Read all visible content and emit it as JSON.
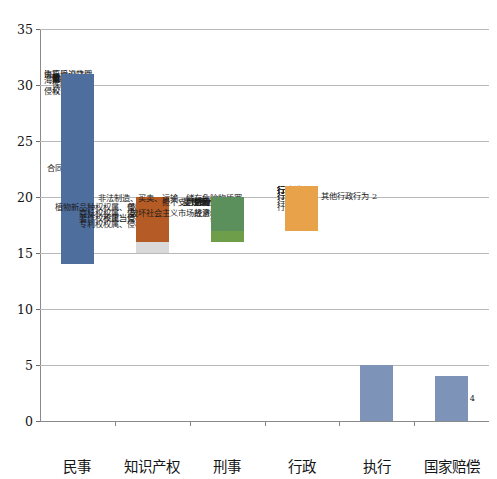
{
  "chart_data": {
    "type": "bar",
    "subtype": "stacked-bar",
    "title": "",
    "subtitle": "",
    "xlabel": "",
    "ylabel": "",
    "ylim": [
      0,
      35
    ],
    "ytick_step": 5,
    "yticks": [
      "0",
      "5",
      "10",
      "15",
      "20",
      "25",
      "30",
      "35"
    ],
    "grid": true,
    "legend": "none",
    "categories": [
      "民事",
      "知识产权",
      "刑事",
      "行政",
      "执行",
      "国家赔偿"
    ],
    "totals": [
      31,
      20,
      20,
      21,
      5,
      4
    ],
    "series": [
      {
        "category": "民事",
        "total": 31,
        "segments": [
          {
            "label": "执行异议之诉",
            "value": 1,
            "color": "#9bbb7a",
            "label_side": "left"
          },
          {
            "label": "物权纠纷",
            "value": 1,
            "color": "#d7a93c",
            "label_side": "left"
          },
          {
            "label": "侵权责任纠纷",
            "value": 4,
            "color": "#d7a93c",
            "label_side": "left"
          },
          {
            "label": "破产纠纷",
            "value": 1,
            "color": "#6f9e4a",
            "label_side": "left"
          },
          {
            "label": "离婚纠纷",
            "value": 1,
            "color": "#d18c3c",
            "label_side": "left"
          },
          {
            "label": "劳动争议",
            "value": 1,
            "color": "#9aa98c",
            "label_side": "left"
          },
          {
            "label": "债权纠纷",
            "value": 1,
            "color": "#6b86ad",
            "label_side": "left"
          },
          {
            "label": "合同纠纷",
            "value": 17,
            "color": "#4e6e9e",
            "label_side": "left"
          },
          {
            "label": "海事诉讼特别程序",
            "value": 1,
            "color": "#4e6e9e",
            "label_side": "left"
          },
          {
            "label": "海事海商纠纷",
            "value": 2,
            "color": "#4e6e9e",
            "label_side": "left"
          },
          {
            "label": "公司纠纷",
            "value": 3,
            "color": "#4e6e9e",
            "label_side": "left"
          },
          {
            "label": "保险纠纷",
            "value": 2,
            "color": "#4e6e9e",
            "label_side": "left"
          }
        ]
      },
      {
        "category": "知识产权",
        "total": 20,
        "segments": [
          {
            "label": "专利权权属、侵权纠纷",
            "value": 5,
            "color": "#d9d9d9",
            "label_side": "left"
          },
          {
            "label": "著作权权属、侵权纠纷",
            "value": 4,
            "color": "#f2c49a",
            "label_side": "left"
          },
          {
            "label": "植物新品种权权属、侵权纠纷",
            "value": 2,
            "color": "#f2c49a",
            "label_side": "left"
          },
          {
            "label": "商标权权属、侵权纠纷",
            "value": 3,
            "color": "#6b86ad",
            "label_side": "left"
          },
          {
            "label": "垄断纠纷",
            "value": 2,
            "color": "#6b86ad",
            "label_side": "left"
          },
          {
            "label": "不正当竞争纠纷",
            "value": 4,
            "color": "#b55b25",
            "label_side": "left"
          }
        ]
      },
      {
        "category": "刑事",
        "total": 20,
        "segments": [
          {
            "label": "危险驾驶罪",
            "value": 1,
            "color": "#e08b3c",
            "label_side": "left"
          },
          {
            "label": "非法制造、买卖、运输、储存危险物质罪",
            "value": 1,
            "color": "#e08b3c",
            "label_side": "left"
          },
          {
            "label": "受贿罪/贪污罪",
            "value": 1,
            "color": "#e08b3c",
            "label_side": "left"
          },
          {
            "label": "受贿罪",
            "value": 1,
            "color": "#6f9e4a",
            "label_side": "left"
          },
          {
            "label": "抢劫罪",
            "value": 4,
            "color": "#6f9e4a",
            "label_side": "left"
          },
          {
            "label": "破坏社会主义市场经济秩序罪",
            "value": 3,
            "color": "#6b86ad",
            "label_side": "left"
          },
          {
            "label": "拒不支付劳动报酬罪",
            "value": 1,
            "color": "#6b86ad",
            "label_side": "left"
          },
          {
            "label": "合同诈骗罪",
            "value": 1,
            "color": "#6b86ad",
            "label_side": "left"
          },
          {
            "label": "故意伤人罪",
            "value": 3,
            "color": "#5b8f5b",
            "label_side": "left"
          },
          {
            "label": "妨害司法罪",
            "value": 1,
            "color": "#5b8f5b",
            "label_side": "left"
          },
          {
            "label": "盗窃罪/诈骗罪",
            "value": 1,
            "color": "#5b8f5b",
            "label_side": "left"
          }
        ]
      },
      {
        "category": "行政",
        "total": 21,
        "segments": [
          {
            "label": "行政登记",
            "value": 1,
            "color": "#e8a34a",
            "label_side": "left"
          },
          {
            "label": "其他行政行为",
            "value": 2,
            "color": "#e08b3c",
            "label_side": "right"
          },
          {
            "label": "行政征收",
            "value": 1,
            "color": "#e08b3c",
            "label_side": "left"
          },
          {
            "label": "行政许可",
            "value": 3,
            "color": "#8a8a8a",
            "label_side": "left"
          },
          {
            "label": "行政受理",
            "value": 1,
            "color": "#e8a34a",
            "label_side": "left"
          },
          {
            "label": "行政确认",
            "value": 2,
            "color": "#6b86ad",
            "label_side": "left"
          },
          {
            "label": "行政批准",
            "value": 2,
            "color": "#5b8f5b",
            "label_side": "left"
          },
          {
            "label": "行政合同",
            "value": 1,
            "color": "#6b86ad",
            "label_side": "left"
          },
          {
            "label": "行政处罚",
            "value": 4,
            "color": "#e8a34a",
            "label_side": "left"
          }
        ]
      },
      {
        "category": "执行",
        "total": 5,
        "segments": [
          {
            "label": "执行",
            "value": 5,
            "color": "#7e93b8",
            "label_side": "center"
          }
        ]
      },
      {
        "category": "国家赔偿",
        "total": 4,
        "segments": [
          {
            "label": "国家赔偿",
            "value": 4,
            "color": "#7e93b8",
            "label_side": "center"
          }
        ]
      }
    ]
  },
  "axis": {
    "y_max_label": "35",
    "y_min_label": "0"
  }
}
